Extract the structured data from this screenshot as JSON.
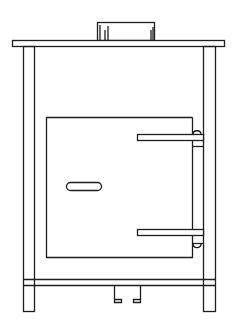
{
  "figure": {
    "stroke_color": "#1e1e1e",
    "background_color": "#ffffff"
  },
  "parts": {
    "flue_collar": {
      "label": "flue collar"
    },
    "top_plate": {
      "label": "top plate"
    },
    "left_leg": {
      "label": "left leg"
    },
    "right_leg": {
      "label": "right leg"
    },
    "firebox_door": {
      "label": "firebox door"
    },
    "door_handle": {
      "label": "door handle"
    },
    "upper_hinge": {
      "label": "upper hinge strap"
    },
    "lower_hinge": {
      "label": "lower hinge strap"
    },
    "bottom_rail": {
      "label": "bottom rail"
    },
    "ash_tab": {
      "label": "ash / damper tab"
    }
  }
}
